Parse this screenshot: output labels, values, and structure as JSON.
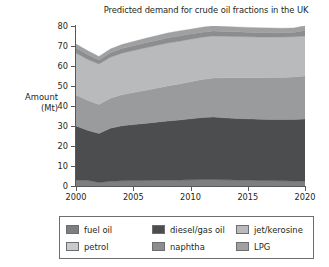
{
  "chart_data": {
    "type": "area",
    "stacked": true,
    "title": "Predicted demand for crude oil fractions in the UK",
    "xlabel": "",
    "ylabel": "Amount (Mt)",
    "ylabel_line1": "Amount",
    "ylabel_line2": "(Mt)",
    "xlim": [
      2000,
      2020
    ],
    "ylim": [
      0,
      80
    ],
    "grid": false,
    "legend_position": "bottom",
    "ytick_labels": [
      "0",
      "10",
      "20",
      "30",
      "40",
      "50",
      "60",
      "70",
      "80"
    ],
    "ytick_values": [
      0,
      10,
      20,
      30,
      40,
      50,
      60,
      70,
      80
    ],
    "xtick_labels": [
      "2000",
      "2005",
      "2010",
      "2015",
      "2020"
    ],
    "xtick_values": [
      2000,
      2005,
      2010,
      2015,
      2020
    ],
    "x": [
      2000,
      2001,
      2002,
      2003,
      2004,
      2005,
      2006,
      2007,
      2008,
      2009,
      2010,
      2011,
      2012,
      2013,
      2014,
      2015,
      2016,
      2017,
      2018,
      2019,
      2020
    ],
    "series": [
      {
        "name": "fuel oil",
        "color": "#7d7e80",
        "values": [
          3.0,
          2.9,
          1.8,
          2.4,
          2.6,
          2.7,
          2.8,
          2.9,
          3.0,
          3.0,
          3.1,
          3.2,
          3.3,
          3.1,
          3.0,
          2.9,
          2.8,
          2.7,
          2.6,
          2.5,
          2.5
        ]
      },
      {
        "name": "diesel/gas oil",
        "color": "#4c4d4f",
        "values": [
          27.0,
          25.0,
          24.5,
          26.5,
          27.5,
          28.0,
          28.5,
          29.0,
          29.5,
          30.0,
          30.5,
          31.0,
          31.2,
          31.0,
          30.8,
          30.7,
          30.6,
          30.6,
          30.7,
          30.8,
          31.0
        ]
      },
      {
        "name": "petrol",
        "color": "#9a9b9d",
        "values": [
          15.5,
          15.0,
          14.5,
          15.0,
          15.5,
          16.0,
          16.5,
          17.0,
          17.5,
          18.0,
          18.5,
          19.0,
          19.5,
          20.0,
          20.3,
          20.5,
          20.7,
          20.9,
          21.0,
          21.2,
          21.5
        ]
      },
      {
        "name": "jet/kerosine",
        "color": "#b9babc",
        "values": [
          21.0,
          20.5,
          20.2,
          20.5,
          20.8,
          21.0,
          21.2,
          21.4,
          21.5,
          21.4,
          21.3,
          21.2,
          21.0,
          20.8,
          20.6,
          20.5,
          20.4,
          20.3,
          20.2,
          20.1,
          20.0
        ]
      },
      {
        "name": "naphtha",
        "color": "#8c8d8f",
        "values": [
          2.5,
          2.4,
          2.0,
          2.2,
          2.3,
          2.4,
          2.5,
          2.5,
          2.6,
          2.6,
          2.6,
          2.5,
          2.5,
          2.4,
          2.4,
          2.3,
          2.3,
          2.2,
          2.2,
          2.2,
          2.8
        ]
      },
      {
        "name": "LPG",
        "color": "#9fa0a2",
        "values": [
          2.0,
          1.9,
          1.8,
          1.9,
          2.0,
          2.1,
          2.2,
          2.3,
          2.4,
          2.5,
          2.4,
          2.5,
          2.6,
          2.5,
          2.4,
          2.4,
          2.3,
          2.3,
          2.2,
          2.2,
          2.3
        ]
      }
    ]
  },
  "legend": {
    "items": [
      {
        "label": "fuel oil",
        "color": "#7d7e80"
      },
      {
        "label": "diesel/gas oil",
        "color": "#4c4d4f"
      },
      {
        "label": "jet/kerosine",
        "color": "#b9babc"
      },
      {
        "label": "petrol",
        "color": "#c9cacc"
      },
      {
        "label": "naphtha",
        "color": "#8c8d8f"
      },
      {
        "label": "LPG",
        "color": "#9fa0a2"
      }
    ]
  }
}
